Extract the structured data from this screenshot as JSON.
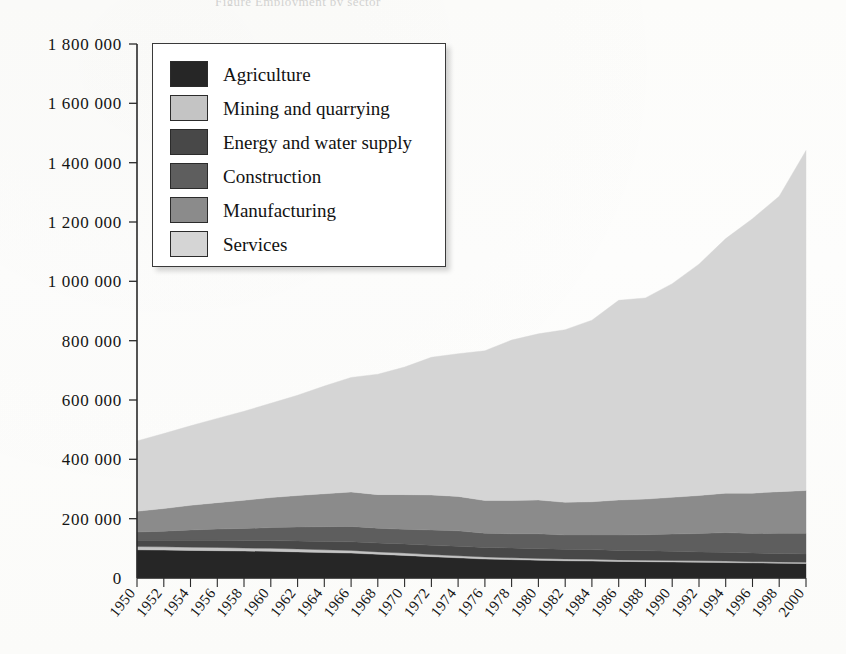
{
  "page": {
    "cropped_header_text": "Figure   Employment by sector",
    "background_color": "#fdfdfb"
  },
  "legend": {
    "position": "upper-left inside plot",
    "entries": [
      {
        "label": "Agriculture",
        "color": "#262626"
      },
      {
        "label": "Mining and quarrying",
        "color": "#c4c4c4"
      },
      {
        "label": "Energy and water supply",
        "color": "#484848"
      },
      {
        "label": "Construction",
        "color": "#5e5e5e"
      },
      {
        "label": "Manufacturing",
        "color": "#8b8b8b"
      },
      {
        "label": "Services",
        "color": "#d5d5d5"
      }
    ]
  },
  "chart_data": {
    "type": "area",
    "stacked": true,
    "title": "",
    "xlabel": "",
    "ylabel": "",
    "grid": false,
    "legend_position": "top-left",
    "xlim": [
      1950,
      2000
    ],
    "ylim": [
      0,
      1800000
    ],
    "ytick_labels": [
      "0",
      "200 000",
      "400 000",
      "600 000",
      "800 000",
      "1 000 000",
      "1 200 000",
      "1 400 000",
      "1 600 000",
      "1 800 000"
    ],
    "ytick_values": [
      0,
      200000,
      400000,
      600000,
      800000,
      1000000,
      1200000,
      1400000,
      1600000,
      1800000
    ],
    "x": [
      1950,
      1952,
      1954,
      1956,
      1958,
      1960,
      1962,
      1964,
      1966,
      1968,
      1970,
      1972,
      1974,
      1976,
      1978,
      1980,
      1982,
      1984,
      1986,
      1988,
      1990,
      1992,
      1994,
      1996,
      1998,
      2000
    ],
    "xtick_labels": [
      "1950",
      "1952",
      "1954",
      "1956",
      "1958",
      "1960",
      "1962",
      "1964",
      "1966",
      "1968",
      "1970",
      "1972",
      "1974",
      "1976",
      "1978",
      "1980",
      "1982",
      "1984",
      "1986",
      "1988",
      "1990",
      "1992",
      "1994",
      "1996",
      "1998",
      "2000"
    ],
    "series": [
      {
        "name": "Agriculture",
        "color": "#262626",
        "values": [
          95000,
          94000,
          93000,
          92000,
          91000,
          90000,
          88000,
          86000,
          84000,
          80000,
          76000,
          72000,
          68000,
          64000,
          62000,
          60000,
          58000,
          57000,
          56000,
          55000,
          54000,
          53000,
          52000,
          51000,
          50000,
          49000
        ]
      },
      {
        "name": "Mining and quarrying",
        "color": "#c4c4c4",
        "values": [
          11000,
          11000,
          11000,
          11000,
          10000,
          10000,
          10000,
          9000,
          9000,
          8000,
          8000,
          7000,
          7000,
          7000,
          6000,
          6000,
          6000,
          6000,
          5000,
          5000,
          5000,
          5000,
          5000,
          4000,
          4000,
          4000
        ]
      },
      {
        "name": "Energy and water supply",
        "color": "#484848",
        "values": [
          21000,
          22000,
          23000,
          24000,
          25000,
          26000,
          27000,
          28000,
          29000,
          30000,
          31000,
          31000,
          32000,
          32000,
          33000,
          33000,
          33000,
          33000,
          32000,
          32000,
          31000,
          30000,
          30000,
          29000,
          29000,
          28000
        ]
      },
      {
        "name": "Construction",
        "color": "#5e5e5e",
        "values": [
          28000,
          31000,
          35000,
          38000,
          41000,
          44000,
          47000,
          50000,
          52000,
          50000,
          49000,
          52000,
          52000,
          48000,
          48000,
          50000,
          48000,
          49000,
          52000,
          54000,
          58000,
          62000,
          66000,
          66000,
          68000,
          70000
        ]
      },
      {
        "name": "Manufacturing",
        "color": "#8b8b8b",
        "values": [
          70000,
          76000,
          83000,
          89000,
          95000,
          101000,
          106000,
          111000,
          116000,
          113000,
          117000,
          118000,
          116000,
          110000,
          112000,
          114000,
          110000,
          112000,
          118000,
          120000,
          124000,
          128000,
          133000,
          136000,
          140000,
          144000
        ]
      },
      {
        "name": "Services",
        "color": "#d5d5d5",
        "values": [
          237000,
          253000,
          268000,
          284000,
          300000,
          318000,
          338000,
          363000,
          386000,
          406000,
          430000,
          464000,
          481000,
          505000,
          541000,
          560000,
          582000,
          612000,
          673000,
          678000,
          720000,
          780000,
          858000,
          925000,
          996000,
          1146000
        ]
      }
    ],
    "totals": [
      462000,
      487000,
      513000,
      538000,
      562000,
      589000,
      616000,
      647000,
      676000,
      687000,
      711000,
      744000,
      756000,
      766000,
      802000,
      823000,
      837000,
      869000,
      936000,
      944000,
      992000,
      1058000,
      1144000,
      1211000,
      1287000,
      1441000
    ]
  }
}
